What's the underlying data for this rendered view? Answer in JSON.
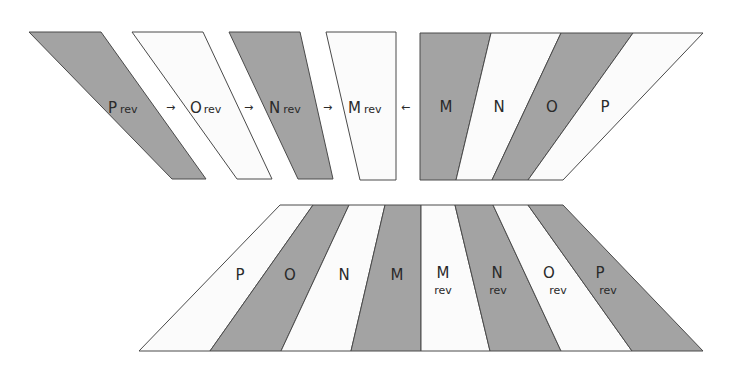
{
  "colors": {
    "gray_fill": "#a3a3a3",
    "white_fill": "#fbfbfb",
    "stroke": "#4a4a4a",
    "text": "#2a2a2a",
    "background": "#ffffff"
  },
  "top_left_group": {
    "strips": [
      {
        "letter": "P",
        "suffix": "rev",
        "fill": "gray"
      },
      {
        "letter": "O",
        "suffix": "rev",
        "fill": "white"
      },
      {
        "letter": "N",
        "suffix": "rev",
        "fill": "gray"
      },
      {
        "letter": "M",
        "suffix": "rev",
        "fill": "white"
      }
    ],
    "arrows": [
      "→",
      "→",
      "→"
    ]
  },
  "middle_arrow": "←",
  "top_right_group": {
    "strips": [
      {
        "letter": "M",
        "fill": "gray"
      },
      {
        "letter": "N",
        "fill": "white"
      },
      {
        "letter": "O",
        "fill": "gray"
      },
      {
        "letter": "P",
        "fill": "white"
      }
    ]
  },
  "bottom_group": {
    "strips": [
      {
        "letter": "P",
        "fill": "white"
      },
      {
        "letter": "O",
        "fill": "gray"
      },
      {
        "letter": "N",
        "fill": "white"
      },
      {
        "letter": "M",
        "fill": "gray"
      },
      {
        "letter": "M",
        "suffix": "rev",
        "fill": "white"
      },
      {
        "letter": "N",
        "suffix": "rev",
        "fill": "gray"
      },
      {
        "letter": "O",
        "suffix": "rev",
        "fill": "white"
      },
      {
        "letter": "P",
        "suffix": "rev",
        "fill": "gray"
      }
    ]
  }
}
